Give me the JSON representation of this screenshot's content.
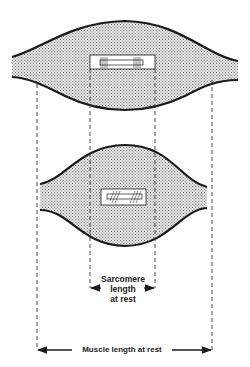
{
  "diagram": {
    "title": "",
    "colors": {
      "outline": "#1a1a1a",
      "fill": "#d0d0d0",
      "dash": "#333333"
    },
    "muscles": [
      {
        "name": "stretched-muscle",
        "shape": "long-flat"
      },
      {
        "name": "contracted-muscle",
        "shape": "short-bulging"
      }
    ],
    "labels": {
      "sarcomere_line1": "Sarcomere",
      "sarcomere_line2": "length",
      "sarcomere_line3": "at rest",
      "muscle": "Muscle length at rest"
    }
  }
}
